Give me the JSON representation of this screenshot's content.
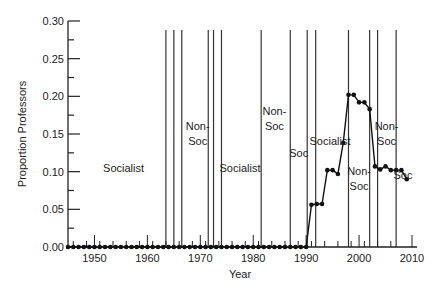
{
  "chart_data": {
    "type": "line",
    "title": "",
    "xlabel": "Year",
    "ylabel": "Proportion Professors",
    "xlim": [
      1945,
      2010
    ],
    "ylim": [
      0.0,
      0.3
    ],
    "grid": false,
    "x_ticks": [
      1950,
      1960,
      1970,
      1980,
      1990,
      2000,
      2010
    ],
    "y_ticks": [
      "0.00",
      "0.05",
      "0.10",
      "0.15",
      "0.20",
      "0.25",
      "0.30"
    ],
    "series": [
      {
        "name": "Proportion Professors",
        "x": [
          1945,
          1946,
          1947,
          1948,
          1949,
          1950,
          1951,
          1952,
          1953,
          1954,
          1955,
          1956,
          1957,
          1958,
          1959,
          1960,
          1961,
          1962,
          1963,
          1964,
          1965,
          1966,
          1967,
          1968,
          1969,
          1970,
          1971,
          1972,
          1973,
          1974,
          1975,
          1976,
          1977,
          1978,
          1979,
          1980,
          1981,
          1982,
          1983,
          1984,
          1985,
          1986,
          1987,
          1988,
          1989,
          1990,
          1991,
          1992,
          1993,
          1994,
          1995,
          1996,
          1997,
          1998,
          1999,
          2000,
          2001,
          2002,
          2003,
          2004,
          2005,
          2006,
          2007,
          2008,
          2009
        ],
        "values": [
          0,
          0,
          0,
          0,
          0,
          0,
          0,
          0,
          0,
          0,
          0,
          0,
          0,
          0,
          0,
          0,
          0,
          0,
          0,
          0,
          0,
          0,
          0,
          0,
          0,
          0,
          0,
          0,
          0,
          0,
          0,
          0,
          0,
          0,
          0,
          0,
          0,
          0,
          0,
          0,
          0,
          0,
          0,
          0,
          0,
          0,
          0.056,
          0.057,
          0.057,
          0.102,
          0.102,
          0.097,
          0.138,
          0.202,
          0.202,
          0.192,
          0.192,
          0.183,
          0.107,
          0.103,
          0.107,
          0.102,
          0.102,
          0.102,
          0.09
        ]
      }
    ],
    "event_lines": [
      1963.5,
      1965,
      1966.5,
      1971.5,
      1972.5,
      1974,
      1981.5,
      1987,
      1990.2,
      1991.8,
      1998,
      2002,
      2003.5,
      2007
    ],
    "minor_ticks_lines": [
      1945,
      1953,
      1962,
      1979,
      1987
    ],
    "annotations": [
      {
        "text": [
          "Socialist"
        ],
        "x": 1955.5,
        "y": 0.1
      },
      {
        "text": [
          "Non-",
          "Soc"
        ],
        "x": 1969.5,
        "y": 0.155
      },
      {
        "text": [
          "Socialist"
        ],
        "x": 1977.5,
        "y": 0.1
      },
      {
        "text": [
          "Non-",
          "Soc"
        ],
        "x": 1984,
        "y": 0.175
      },
      {
        "text": [
          "Soc"
        ],
        "x": 1988.6,
        "y": 0.12
      },
      {
        "text": [
          "Socialist"
        ],
        "x": 1994.5,
        "y": 0.135
      },
      {
        "text": [
          "Non-",
          "Soc"
        ],
        "x": 2000,
        "y": 0.095
      },
      {
        "text": [
          "Non-",
          "Soc"
        ],
        "x": 2005.2,
        "y": 0.155
      },
      {
        "text": [
          "Soc"
        ],
        "x": 2008.3,
        "y": 0.09
      }
    ]
  }
}
